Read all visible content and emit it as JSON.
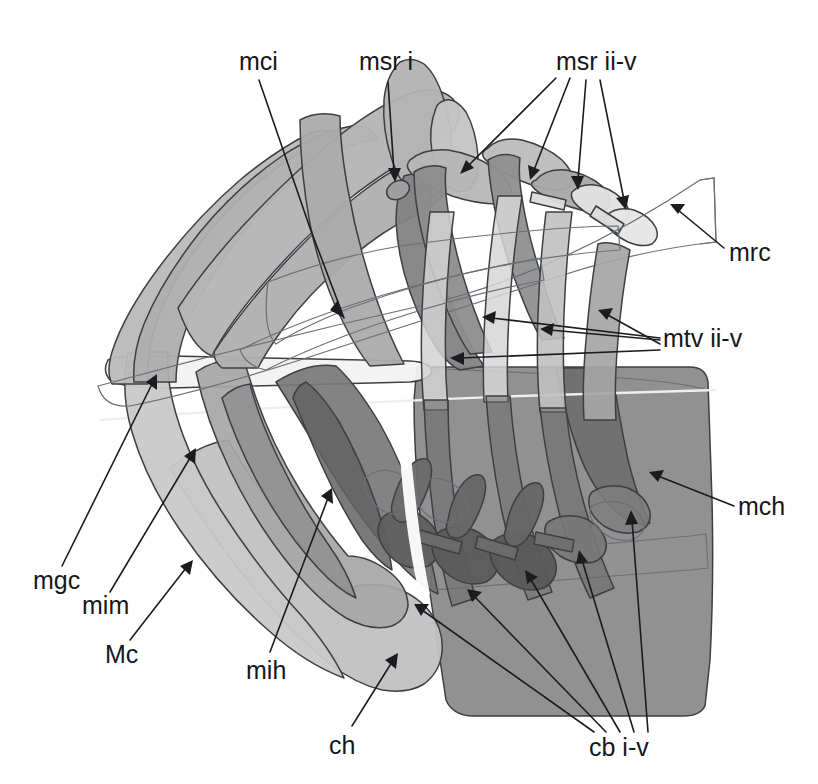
{
  "figure": {
    "type": "line-art-anatomical-illustration",
    "width": 818,
    "height": 784,
    "background_color": "#ffffff"
  },
  "palette": {
    "background": "#ffffff",
    "outline": "#3c3f43",
    "leader_line": "#1b1c1f",
    "label_text": "#16171a",
    "tone_very_light": "#f0f0f0",
    "tone_light": "#d9d9d9",
    "tone_light_mid": "#c6c6c6",
    "tone_mid": "#b0b0b0",
    "tone_mid_dark": "#9a9a9a",
    "tone_dark": "#858585",
    "tone_darker": "#6f6f6f",
    "tone_darkest": "#5c5c5c"
  },
  "labels": [
    {
      "id": "mci",
      "text": "mci",
      "x": 239,
      "y": 70,
      "anchor": "start",
      "arrows": 1
    },
    {
      "id": "msr-i",
      "text": "msr i",
      "x": 359,
      "y": 70,
      "anchor": "start",
      "arrows": 1
    },
    {
      "id": "msr-ii-v",
      "text": "msr ii-v",
      "x": 556,
      "y": 70,
      "anchor": "start",
      "arrows": 4
    },
    {
      "id": "mrc",
      "text": "mrc",
      "x": 729,
      "y": 261,
      "anchor": "start",
      "arrows": 1
    },
    {
      "id": "mtv-ii-v",
      "text": "mtv ii-v",
      "x": 663,
      "y": 347,
      "anchor": "start",
      "arrows": 4
    },
    {
      "id": "mch",
      "text": "mch",
      "x": 738,
      "y": 515,
      "anchor": "start",
      "arrows": 1
    },
    {
      "id": "mgc",
      "text": "mgc",
      "x": 33,
      "y": 589,
      "anchor": "start",
      "arrows": 1
    },
    {
      "id": "mim",
      "text": "mim",
      "x": 82,
      "y": 614,
      "anchor": "start",
      "arrows": 1
    },
    {
      "id": "Mc",
      "text": "Mc",
      "x": 105,
      "y": 663,
      "anchor": "start",
      "arrows": 1
    },
    {
      "id": "mih",
      "text": "mih",
      "x": 246,
      "y": 679,
      "anchor": "start",
      "arrows": 1
    },
    {
      "id": "ch",
      "text": "ch",
      "x": 329,
      "y": 754,
      "anchor": "start",
      "arrows": 1
    },
    {
      "id": "cb-i-v",
      "text": "cb i-v",
      "x": 589,
      "y": 756,
      "anchor": "start",
      "arrows": 5
    }
  ],
  "structures": [
    {
      "id": "mci",
      "name": "mandibular cranial interior muscle",
      "tone": "tone_mid"
    },
    {
      "id": "msr-i",
      "name": "maxillary segmental remotor i",
      "tone": "tone_dark"
    },
    {
      "id": "msr-ii-v",
      "name": "maxillary segmental remotors ii-v",
      "tone": "tone_dark"
    },
    {
      "id": "mrc",
      "name": "maxillary rostral connective",
      "tone": "tone_very_light"
    },
    {
      "id": "mtv-ii-v",
      "name": "maxillary transverse ventrals ii-v",
      "tone": "tone_mid_dark"
    },
    {
      "id": "mch",
      "name": "mandibular chamber",
      "tone": "tone_darker"
    },
    {
      "id": "mgc",
      "name": "mandibular gnathal connective",
      "tone": "tone_very_light"
    },
    {
      "id": "mim",
      "name": "mandibular internal muscle",
      "tone": "tone_mid"
    },
    {
      "id": "Mc",
      "name": "mandibular coxa",
      "tone": "tone_light_mid"
    },
    {
      "id": "mih",
      "name": "mandibular internal head muscle",
      "tone": "tone_dark"
    },
    {
      "id": "ch",
      "name": "coxal head",
      "tone": "tone_light_mid"
    },
    {
      "id": "cb-i-v",
      "name": "coxal bodies i-v",
      "tone": "tone_darkest"
    }
  ]
}
